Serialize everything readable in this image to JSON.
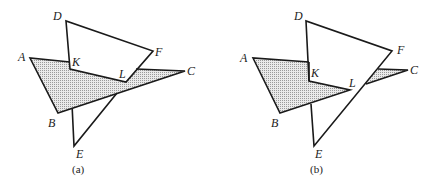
{
  "figures": [
    {
      "caption": "(a)",
      "labels": {
        "A": "A",
        "B": "B",
        "C": "C",
        "D": "D",
        "E": "E",
        "F": "F",
        "K": "K",
        "L": "L"
      }
    },
    {
      "caption": "(b)",
      "labels": {
        "A": "A",
        "B": "B",
        "C": "C",
        "D": "D",
        "E": "E",
        "F": "F",
        "K": "K",
        "L": "L"
      }
    }
  ],
  "colors": {
    "stroke": "#1a1a1a",
    "hatch": "#9a9a9a",
    "hatch_bg": "#e6e6e6"
  }
}
